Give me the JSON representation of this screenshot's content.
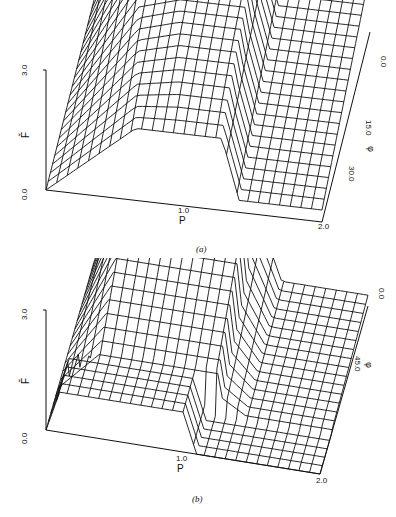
{
  "chart_data": [
    {
      "type": "surface3d",
      "panel": "(a)",
      "zlabel": "F̌",
      "xlabel": "P",
      "ylabel": "φ",
      "z_ticks": [
        "0.0",
        "3.0"
      ],
      "x_ticks": [
        "1.0",
        "2.0"
      ],
      "y_ticks": [
        "0.0",
        "15.0",
        "30.0"
      ],
      "xlim": [
        0,
        2.0
      ],
      "zlim": [
        0,
        3.0
      ],
      "description": "Wireframe surface: F rises linearly from 0 at P=0 to ~3.0 at P~0.3 over back rows (ridge), dips in a V near P~0.65 on front rows, plateau near 3.0 until P~1.3, then sharp drop to a flat level (~1.5) for P>1.3 to 2.0"
    },
    {
      "type": "surface3d",
      "panel": "(b)",
      "zlabel": "F̌",
      "xlabel": "P",
      "ylabel": "φ",
      "z_ticks": [
        "0.0",
        "3.0"
      ],
      "x_ticks": [
        "1.0",
        "2.0"
      ],
      "y_ticks": [
        "0.0",
        "45.0"
      ],
      "xlim": [
        0,
        2.0
      ],
      "zlim": [
        0,
        3.0
      ],
      "description": "Wireframe surface: back rows high plateau (~3.0) between P~0.3 and ~1.2, front rows low step (~1.0) from P=0 to 1.0 then drop to 0; flat low level for P>1.2"
    }
  ],
  "panels": {
    "a": {
      "caption": "(a)",
      "z_top": "3.0",
      "z_bottom": "0.0",
      "z_label": "F̌",
      "x_tick": "1.0",
      "x_end": "2.0",
      "x_label": "P",
      "y_tick0": "0.0",
      "y_tick1": "15.0",
      "y_tick2": "30.0",
      "y_label": "φ"
    },
    "b": {
      "caption": "(b)",
      "z_top": "3.0",
      "z_bottom": "0.0",
      "z_label": "F̌",
      "x_tick": "1.0",
      "x_end": "2.0",
      "x_label": "P",
      "y_tick0": "0.0",
      "y_tick1": "45.0",
      "y_label": "φ"
    }
  }
}
